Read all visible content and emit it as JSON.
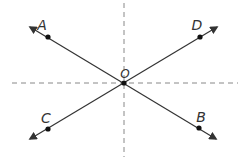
{
  "diagram": {
    "center": {
      "label": "O",
      "x": 124,
      "y": 83
    },
    "points": [
      {
        "label": "A",
        "x": 48,
        "y": 37,
        "label_x": 42,
        "label_y": 30
      },
      {
        "label": "D",
        "x": 200,
        "y": 37,
        "label_x": 192,
        "label_y": 31
      },
      {
        "label": "C",
        "x": 48,
        "y": 129,
        "label_x": 40,
        "label_y": 124
      },
      {
        "label": "B",
        "x": 199,
        "y": 128,
        "label_x": 197,
        "label_y": 121
      }
    ],
    "lines": [
      {
        "name": "line-AB",
        "from": "A",
        "to": "B",
        "x1": 30,
        "y1": 27,
        "x2": 216,
        "y2": 139
      },
      {
        "name": "line-CD",
        "from": "C",
        "to": "D",
        "x1": 30,
        "y1": 139,
        "x2": 217,
        "y2": 27
      }
    ],
    "axes": {
      "horizontal": {
        "x1": 12,
        "y1": 83,
        "x2": 238,
        "y2": 83,
        "style": "dashed"
      },
      "vertical": {
        "x1": 124,
        "y1": 3,
        "x2": 124,
        "y2": 157,
        "style": "dashed"
      }
    },
    "colors": {
      "line": "#333333",
      "axis": "#888888",
      "point": "#111111"
    }
  }
}
